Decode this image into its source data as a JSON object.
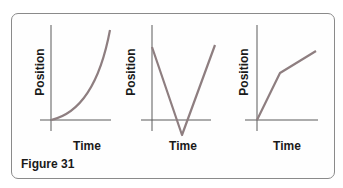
{
  "figure": {
    "caption": "Figure 31",
    "graphs": [
      {
        "id": "graph-1",
        "ylabel": "Position",
        "xlabel": "Time",
        "shape": "curve increasing upward (accelerating)"
      },
      {
        "id": "graph-2",
        "ylabel": "Position",
        "xlabel": "Time",
        "shape": "V shape dipping below time axis"
      },
      {
        "id": "graph-3",
        "ylabel": "Position",
        "xlabel": "Time",
        "shape": "steep line then shallower line (two linear segments)"
      }
    ]
  },
  "colors": {
    "line": "#8e7e80",
    "axis": "#5a5a5a",
    "border": "#8a8a8a"
  }
}
